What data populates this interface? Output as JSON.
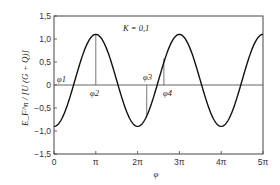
{
  "chart_data": {
    "type": "line",
    "title": "",
    "annotation_text": "K = 0,1",
    "xlabel": "φ",
    "ylabel": "E_F^n / [U (G + Q)]",
    "xlim": [
      0,
      15.708
    ],
    "ylim": [
      -1.5,
      1.5
    ],
    "x_ticks": [
      {
        "value": 0,
        "label": "0"
      },
      {
        "value": 3.1416,
        "label": "π"
      },
      {
        "value": 6.2832,
        "label": "2π"
      },
      {
        "value": 9.4248,
        "label": "3π"
      },
      {
        "value": 12.566,
        "label": "4π"
      },
      {
        "value": 15.708,
        "label": "5π"
      }
    ],
    "y_ticks": [
      {
        "value": 1.5,
        "label": "1,5"
      },
      {
        "value": 1.0,
        "label": "1,0"
      },
      {
        "value": 0.5,
        "label": "0,5"
      },
      {
        "value": 0,
        "label": "0"
      },
      {
        "value": -0.5,
        "label": "-0,5"
      },
      {
        "value": -1.0,
        "label": "-1,0"
      },
      {
        "value": -1.5,
        "label": "-1,5"
      }
    ],
    "grid": false,
    "legend": null,
    "series": [
      {
        "name": "K = 0,1",
        "function": "K - cos(φ)",
        "K": 0.1,
        "x": [
          0,
          0.785,
          1.571,
          2.356,
          3.142,
          3.927,
          4.712,
          5.498,
          6.283,
          7.069,
          7.854,
          8.639,
          9.425,
          10.21,
          10.996,
          11.781,
          12.566,
          13.352,
          14.137,
          14.923,
          15.708
        ],
        "values": [
          -0.9,
          -0.607,
          0.1,
          0.807,
          1.1,
          0.807,
          0.1,
          -0.607,
          -0.9,
          -0.607,
          0.1,
          0.807,
          1.1,
          0.807,
          0.1,
          -0.607,
          -0.9,
          -0.607,
          0.1,
          0.807,
          1.1
        ]
      }
    ],
    "markers": [
      {
        "label": "φ1",
        "x": 0.0,
        "y": 0,
        "note": "label at origin on zero line"
      },
      {
        "label": "φ2",
        "x": 3.1416,
        "y_top": 1.1,
        "note": "vertical line from 0 to curve peak"
      },
      {
        "label": "φ3",
        "x": 6.97,
        "y_bottom": -0.65,
        "note": "vertical line from 0 down to curve"
      },
      {
        "label": "φ4",
        "x": 8.26,
        "y_top": 0.58,
        "note": "vertical line from 0 up to curve"
      }
    ]
  },
  "labels": {
    "k_annotation": "K = 0,1",
    "x_axis_title": "φ",
    "y_axis_title": "E_F^n / [U (G + Q)]",
    "phi1": "φ1",
    "phi2": "φ2",
    "phi3": "φ3",
    "phi4": "φ4"
  }
}
